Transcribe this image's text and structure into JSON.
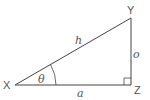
{
  "diagram": {
    "title": "",
    "type": "right-triangle",
    "colors": {
      "stroke": "#444444",
      "text": "#555555",
      "background": "#ffffff"
    },
    "vertices": {
      "X": {
        "label": "X",
        "x": 15,
        "y": 85
      },
      "Y": {
        "label": "Y",
        "x": 131,
        "y": 18
      },
      "Z": {
        "label": "Z",
        "x": 131,
        "y": 85
      }
    },
    "sides": {
      "hypotenuse": {
        "label": "h",
        "from": "X",
        "to": "Y"
      },
      "opposite": {
        "label": "o",
        "from": "Y",
        "to": "Z"
      },
      "adjacent": {
        "label": "a",
        "from": "X",
        "to": "Z"
      }
    },
    "angle": {
      "label": "θ",
      "at": "X"
    },
    "right_angle_marker": {
      "at": "Z"
    }
  }
}
